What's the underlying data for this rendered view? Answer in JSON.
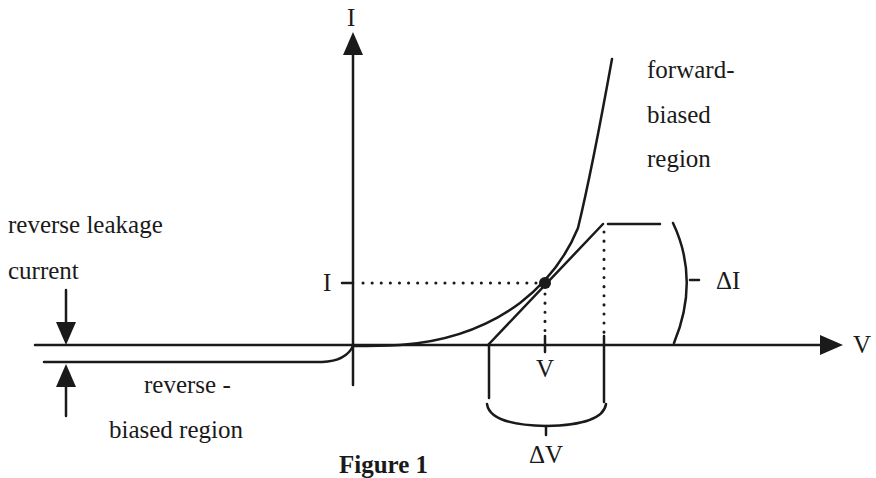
{
  "figure": {
    "caption": "Figure 1",
    "axes": {
      "x_label": "V",
      "y_label": "I"
    },
    "annotations": {
      "operating_current": "I",
      "operating_voltage": "V",
      "delta_i": "ΔI",
      "delta_v": "ΔV",
      "forward_line1": "forward-",
      "forward_line2": "biased",
      "forward_line3": "region",
      "leakage_line1": "reverse leakage",
      "leakage_line2": "current",
      "reverse_line1": "reverse -",
      "reverse_line2": "biased region"
    },
    "colors": {
      "ink": "#1a1a1a",
      "background": "#ffffff"
    }
  }
}
